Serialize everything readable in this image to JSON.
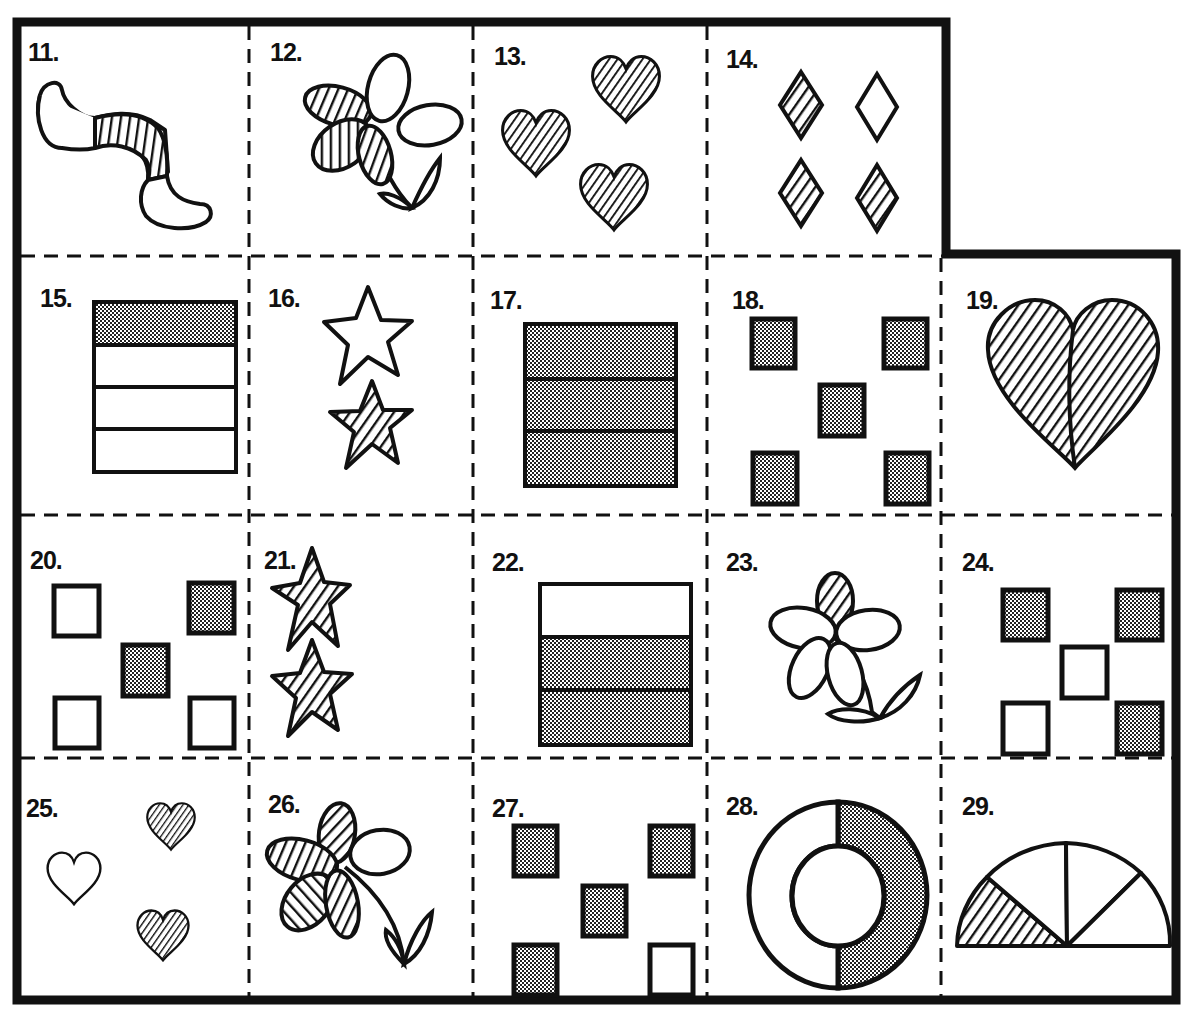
{
  "worksheet": {
    "colors": {
      "ink": "#111111",
      "paper": "#ffffff",
      "dot_fill": "#8a8a8a"
    },
    "cells": [
      {
        "number": "11.",
        "label": "worm",
        "description": "worm with striped middle section"
      },
      {
        "number": "12.",
        "label": "flower",
        "description": "flower with three striped petals and two plain petals"
      },
      {
        "number": "13.",
        "label": "hearts",
        "description": "three striped hearts"
      },
      {
        "number": "14.",
        "label": "diamonds",
        "description": "three striped diamonds and one plain diamond"
      },
      {
        "number": "15.",
        "label": "rectangle-4",
        "description": "rectangle of four bands, top band dotted"
      },
      {
        "number": "16.",
        "label": "stars",
        "description": "one plain star, one striped star"
      },
      {
        "number": "17.",
        "label": "rectangle-3",
        "description": "rectangle of three bands, all dotted"
      },
      {
        "number": "18.",
        "label": "squares",
        "description": "five dotted squares"
      },
      {
        "number": "19.",
        "label": "big-heart",
        "description": "heart split in two halves, both striped"
      },
      {
        "number": "20.",
        "label": "squares",
        "description": "two dotted squares, three plain squares"
      },
      {
        "number": "21.",
        "label": "stars",
        "description": "two striped stars"
      },
      {
        "number": "22.",
        "label": "rectangle-3",
        "description": "rectangle of three bands, bottom two dotted"
      },
      {
        "number": "23.",
        "label": "flower",
        "description": "flower with one striped petal and four plain petals"
      },
      {
        "number": "24.",
        "label": "squares",
        "description": "three dotted squares, two plain squares"
      },
      {
        "number": "25.",
        "label": "hearts",
        "description": "two striped hearts, one plain heart"
      },
      {
        "number": "26.",
        "label": "flower",
        "description": "flower with four striped petals and one plain petal"
      },
      {
        "number": "27.",
        "label": "squares",
        "description": "four dotted squares, one plain square"
      },
      {
        "number": "28.",
        "label": "ring",
        "description": "ring split in half, right half dotted"
      },
      {
        "number": "29.",
        "label": "semicircle",
        "description": "semicircle in four sections, left section striped"
      }
    ]
  }
}
